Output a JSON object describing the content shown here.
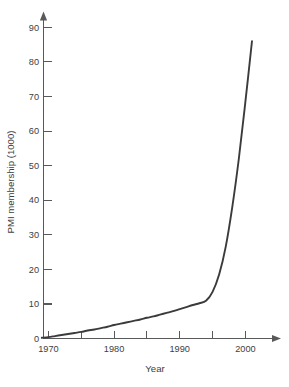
{
  "chart_data": {
    "type": "line",
    "title": "",
    "subtitle": "",
    "xlabel": "Year",
    "ylabel": "PMI membership (1000)",
    "xlim": [
      1968.2,
      2003.5
    ],
    "ylim": [
      0,
      93
    ],
    "grid": false,
    "legend": null,
    "annotations": [],
    "x_ticks": [
      {
        "value": 1970,
        "label": "1970"
      },
      {
        "value": 1975,
        "label": ""
      },
      {
        "value": 1980,
        "label": "1980"
      },
      {
        "value": 1985,
        "label": ""
      },
      {
        "value": 1990,
        "label": "1990"
      },
      {
        "value": 1995,
        "label": ""
      },
      {
        "value": 2000,
        "label": "2000"
      }
    ],
    "y_ticks": [
      {
        "value": 0,
        "label": "0"
      },
      {
        "value": 10,
        "label": "10"
      },
      {
        "value": 20,
        "label": "20"
      },
      {
        "value": 30,
        "label": "30"
      },
      {
        "value": 40,
        "label": "40"
      },
      {
        "value": 50,
        "label": "50"
      },
      {
        "value": 60,
        "label": "60"
      },
      {
        "value": 70,
        "label": "70"
      },
      {
        "value": 80,
        "label": "80"
      },
      {
        "value": 90,
        "label": "90"
      }
    ],
    "series": [
      {
        "name": "PMI membership",
        "color": "#3b3b3d",
        "x": [
          1969,
          1970,
          1971,
          1972,
          1973,
          1974,
          1975,
          1976,
          1977,
          1978,
          1979,
          1980,
          1981,
          1982,
          1983,
          1984,
          1985,
          1986,
          1987,
          1988,
          1989,
          1990,
          1991,
          1992,
          1993,
          1994,
          1995,
          1996,
          1997,
          1998,
          1999,
          2000,
          2001
        ],
        "values": [
          0.2,
          0.4,
          0.7,
          1.0,
          1.3,
          1.6,
          1.9,
          2.3,
          2.6,
          3.0,
          3.4,
          3.9,
          4.3,
          4.7,
          5.1,
          5.5,
          6.0,
          6.4,
          6.9,
          7.4,
          7.9,
          8.5,
          9.1,
          9.7,
          10.2,
          10.9,
          13.5,
          18.5,
          26.5,
          38.0,
          52.0,
          68.5,
          86.0
        ]
      }
    ]
  },
  "axis_colors": {
    "axis": "#58595b",
    "curve": "#3b3b3d",
    "text": "#404042",
    "background": "#ffffff"
  }
}
